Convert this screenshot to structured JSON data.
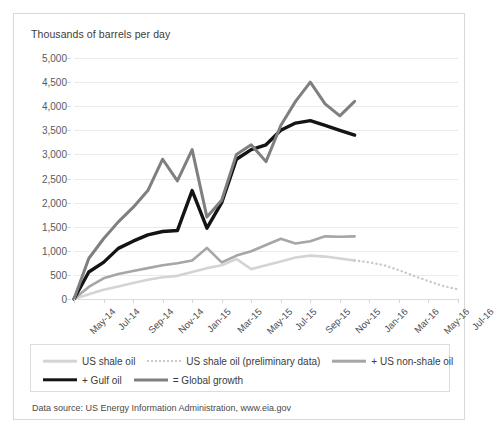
{
  "axis_title": "Thousands of barrels per day",
  "source_note": "Data source: US Energy Information Administration, www.eia.gov",
  "legend": {
    "rows": [
      [
        {
          "label": "US shale oil",
          "style": "solid",
          "color": "#d4d4d4",
          "width": 2.6
        },
        {
          "label": "US shale oil (preliminary data)",
          "style": "dotted",
          "color": "#c9c9c9",
          "width": 2.2
        },
        {
          "label": "+ US non-shale oil",
          "style": "solid",
          "color": "#a6a6a6",
          "width": 2.6
        }
      ],
      [
        {
          "label": "+ Gulf oil",
          "style": "solid",
          "color": "#141414",
          "width": 3.4
        },
        {
          "label": "= Global growth",
          "style": "solid",
          "color": "#7f7f7f",
          "width": 3.0
        }
      ]
    ]
  },
  "chart_data": {
    "type": "line",
    "title": "",
    "subtitle": "",
    "xlabel": "",
    "ylabel": "Thousands of barrels per day",
    "ylim": [
      0,
      5000
    ],
    "ytick_step": 500,
    "yticks": [
      "0",
      "500",
      "1,000",
      "1,500",
      "2,000",
      "2,500",
      "3,000",
      "3,500",
      "4,000",
      "4,500",
      "5,000"
    ],
    "grid": true,
    "legend_position": "bottom",
    "x": [
      "May-14",
      "Jun-14",
      "Jul-14",
      "Aug-14",
      "Sep-14",
      "Oct-14",
      "Nov-14",
      "Dec-14",
      "Jan-15",
      "Feb-15",
      "Mar-15",
      "Apr-15",
      "May-15",
      "Jun-15",
      "Jul-15",
      "Aug-15",
      "Sep-15",
      "Oct-15",
      "Nov-15",
      "Dec-15",
      "Jan-16",
      "Feb-16",
      "Mar-16",
      "Apr-16",
      "May-16",
      "Jun-16",
      "Jul-16"
    ],
    "xtick_labels": [
      "May-14",
      "Jul-14",
      "Sep-14",
      "Nov-14",
      "Jan-15",
      "Mar-15",
      "May-15",
      "Jul-15",
      "Sep-15",
      "Nov-15",
      "Jan-16",
      "Mar-16",
      "May-16",
      "Jul-16"
    ],
    "xtick_indices": [
      0,
      2,
      4,
      6,
      8,
      10,
      12,
      14,
      16,
      18,
      20,
      22,
      24,
      26
    ],
    "series": [
      {
        "name": "US shale oil",
        "color": "#d4d4d4",
        "style": "solid",
        "width": 2.6,
        "values": [
          0,
          100,
          190,
          260,
          330,
          400,
          450,
          480,
          560,
          640,
          700,
          830,
          620,
          700,
          780,
          860,
          900,
          880,
          840,
          800,
          null,
          null,
          null,
          null,
          null,
          null,
          null
        ]
      },
      {
        "name": "US shale oil (preliminary data)",
        "color": "#c9c9c9",
        "style": "dotted",
        "width": 2.4,
        "values": [
          null,
          null,
          null,
          null,
          null,
          null,
          null,
          null,
          null,
          null,
          null,
          null,
          null,
          null,
          null,
          null,
          null,
          null,
          null,
          800,
          760,
          700,
          600,
          480,
          370,
          270,
          200
        ]
      },
      {
        "name": "+ US non-shale oil",
        "color": "#a6a6a6",
        "style": "solid",
        "width": 2.6,
        "values": [
          0,
          250,
          430,
          520,
          580,
          640,
          700,
          740,
          800,
          1060,
          760,
          900,
          990,
          1120,
          1250,
          1150,
          1200,
          1300,
          1290,
          1300,
          null,
          null,
          null,
          null,
          null,
          null,
          null
        ]
      },
      {
        "name": "+ Gulf oil",
        "color": "#141414",
        "style": "solid",
        "width": 3.4,
        "values": [
          0,
          560,
          760,
          1050,
          1200,
          1330,
          1400,
          1420,
          2250,
          1470,
          2000,
          2900,
          3100,
          3200,
          3500,
          3650,
          3700,
          3600,
          3500,
          3400,
          null,
          null,
          null,
          null,
          null,
          null,
          null
        ]
      },
      {
        "name": "= Global growth",
        "color": "#7f7f7f",
        "style": "solid",
        "width": 3.0,
        "values": [
          0,
          840,
          1250,
          1600,
          1900,
          2250,
          2900,
          2450,
          3100,
          1700,
          2050,
          3000,
          3200,
          2850,
          3600,
          4100,
          4500,
          4050,
          3800,
          4100,
          null,
          null,
          null,
          null,
          null,
          null,
          null
        ]
      }
    ]
  }
}
